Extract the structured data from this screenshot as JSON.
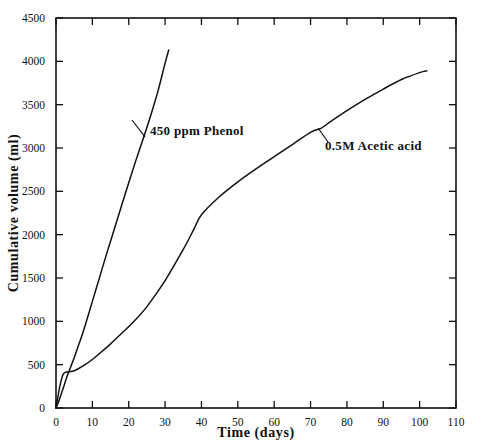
{
  "chart_data": {
    "type": "line",
    "title": "",
    "xlabel": "Time (days)",
    "ylabel": "Cumulative volume (ml)",
    "xlim": [
      0,
      110
    ],
    "ylim": [
      0,
      4500
    ],
    "xticks": [
      0,
      10,
      20,
      30,
      40,
      50,
      60,
      70,
      80,
      90,
      100,
      110
    ],
    "yticks": [
      0,
      500,
      1000,
      1500,
      2000,
      2500,
      3000,
      3500,
      4000,
      4500
    ],
    "xtick_labels": [
      "0",
      "10",
      "20",
      "30",
      "40",
      "50",
      "60",
      "70",
      "80",
      "90",
      "100",
      "110"
    ],
    "ytick_labels": [
      "0",
      "500",
      "1000",
      "1500",
      "2000",
      "2500",
      "3000",
      "3500",
      "4000",
      "4500"
    ],
    "grid": false,
    "legend": "inline-annotations",
    "line_color": "#111111",
    "axis_color": "#111111",
    "background": "#ffffff",
    "series": [
      {
        "name": "450 ppm Phenol",
        "annotation": "450 ppm Phenol",
        "x": [
          0,
          0.6,
          1.2,
          2,
          3,
          4,
          5,
          6,
          7,
          8,
          10,
          12,
          14,
          16,
          18,
          20,
          22,
          24,
          26,
          28,
          30,
          31
        ],
        "values": [
          0,
          60,
          130,
          230,
          360,
          470,
          580,
          700,
          820,
          950,
          1230,
          1510,
          1790,
          2060,
          2330,
          2600,
          2860,
          3110,
          3370,
          3650,
          3980,
          4130
        ]
      },
      {
        "name": "0.5M Acetic acid",
        "annotation": "0.5M Acetic acid",
        "x": [
          0,
          0.5,
          1,
          1.5,
          2,
          2.5,
          3,
          4,
          5,
          6,
          8,
          10,
          12,
          15,
          18,
          21,
          25,
          30,
          35,
          38,
          40,
          45,
          50,
          55,
          60,
          65,
          70,
          73,
          75,
          80,
          85,
          90,
          95,
          100,
          102
        ],
        "values": [
          0,
          120,
          240,
          330,
          390,
          410,
          415,
          420,
          430,
          450,
          500,
          560,
          630,
          740,
          860,
          980,
          1170,
          1470,
          1830,
          2070,
          2230,
          2440,
          2610,
          2760,
          2900,
          3040,
          3180,
          3230,
          3290,
          3430,
          3560,
          3680,
          3790,
          3870,
          3890
        ]
      }
    ],
    "annotations": [
      {
        "text": "450 ppm Phenol",
        "at_x": 22,
        "at_y": 3000,
        "label_px": {
          "x": 150,
          "y": 135
        },
        "leader": {
          "x1": 145,
          "y1": 137,
          "x2": 132,
          "y2": 120
        }
      },
      {
        "text": "0.5M Acetic acid",
        "at_x": 74,
        "at_y": 3250,
        "label_px": {
          "x": 325,
          "y": 150
        },
        "leader": {
          "x1": 328,
          "y1": 142,
          "x2": 318,
          "y2": 128
        }
      }
    ]
  }
}
